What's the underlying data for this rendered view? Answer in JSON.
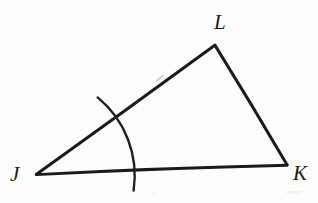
{
  "figure": {
    "kind": "geometry-diagram",
    "background_color": "#fdfdfd",
    "ink_color": "#1b1b1b",
    "stroke_width": 2.6,
    "canvas": {
      "width": 318,
      "height": 203
    },
    "vertices": [
      {
        "id": "J",
        "label": "J",
        "x": 36,
        "y": 174,
        "label_x": 10,
        "label_y": 164
      },
      {
        "id": "K",
        "label": "K",
        "x": 287,
        "y": 165,
        "label_x": 293,
        "label_y": 163
      },
      {
        "id": "L",
        "label": "L",
        "x": 215,
        "y": 45,
        "label_x": 214,
        "label_y": 12
      }
    ],
    "edges": [
      {
        "id": "JL",
        "from": "J",
        "to": "L",
        "name": "side-jl"
      },
      {
        "id": "LK",
        "from": "L",
        "to": "K",
        "name": "side-lk"
      },
      {
        "id": "JK",
        "from": "J",
        "to": "K",
        "name": "side-jk"
      }
    ],
    "angle_marks": [
      {
        "id": "angle-J",
        "at_vertex": "J",
        "type": "arc",
        "radius": 101,
        "start_x": 98,
        "start_y": 98,
        "end_x": 133,
        "end_y": 190,
        "overshoot": true,
        "name": "angle-arc-j"
      }
    ],
    "tick_marks": [
      {
        "id": "tick-jl",
        "on_edge": "JL",
        "x": 160,
        "y": 78,
        "faint": true,
        "name": "tick-mark-jl"
      }
    ]
  }
}
